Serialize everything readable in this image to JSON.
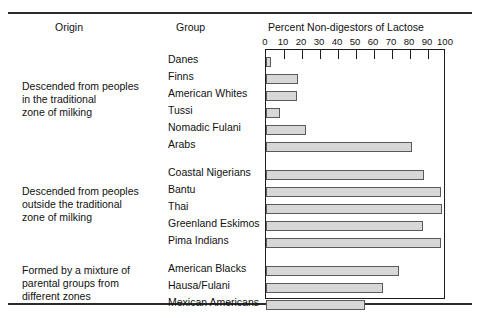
{
  "headers": {
    "origin": "Origin",
    "group": "Group",
    "percent": "Percent Non-digestors of Lactose"
  },
  "axis": {
    "ticks": [
      0,
      10,
      20,
      30,
      40,
      50,
      60,
      70,
      80,
      90,
      100
    ],
    "min": 0,
    "max": 100
  },
  "origins": [
    {
      "lines": [
        "Descended from peoples",
        "in the traditional",
        "zone of milking"
      ]
    },
    {
      "lines": [
        "Descended from peoples",
        "outside the traditional",
        "zone of milking"
      ]
    },
    {
      "lines": [
        "Formed by a mixture of",
        "parental groups from",
        "different zones"
      ]
    }
  ],
  "chart_data": {
    "type": "bar",
    "orientation": "horizontal",
    "title": "Percent Non-digestors of Lactose",
    "xlabel": "Percent Non-digestors of Lactose",
    "ylabel": "Group",
    "xlim": [
      0,
      100
    ],
    "grid": false,
    "legend": false,
    "bar_color": "#d7d7d7",
    "bar_border_color": "#5a5a5a",
    "categories": [
      "Danes",
      "Finns",
      "American Whites",
      "Tussi",
      "Nomadic Fulani",
      "Arabs",
      "Coastal Nigerians",
      "Bantu",
      "Thai",
      "Greenland Eskimos",
      "Pima Indians",
      "American Blacks",
      "Hausa/Fulani",
      "Mexican Americans"
    ],
    "values": [
      3,
      18,
      17,
      8,
      22,
      81,
      88,
      97,
      98,
      87,
      97,
      74,
      65,
      55
    ],
    "groups": [
      {
        "origin": "Descended from peoples in the traditional zone of milking",
        "categories": [
          "Danes",
          "Finns",
          "American Whites",
          "Tussi",
          "Nomadic Fulani",
          "Arabs"
        ],
        "values": [
          3,
          18,
          17,
          8,
          22,
          81
        ]
      },
      {
        "origin": "Descended from peoples outside the traditional zone of milking",
        "categories": [
          "Coastal Nigerians",
          "Bantu",
          "Thai",
          "Greenland Eskimos",
          "Pima Indians"
        ],
        "values": [
          88,
          97,
          98,
          87,
          97
        ]
      },
      {
        "origin": "Formed by a mixture of parental groups from different zones",
        "categories": [
          "American Blacks",
          "Hausa/Fulani",
          "Mexican Americans"
        ],
        "values": [
          74,
          65,
          55
        ]
      }
    ]
  }
}
